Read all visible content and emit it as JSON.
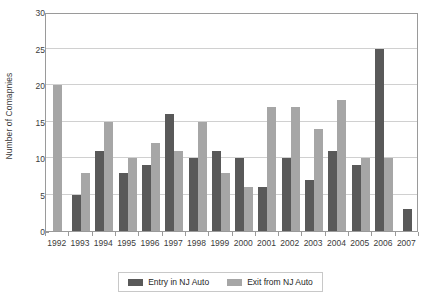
{
  "chart_data": {
    "type": "bar",
    "title": "",
    "xlabel": "",
    "ylabel": "Number of Comapnies",
    "ylim": [
      0,
      30
    ],
    "yticks": [
      0,
      5,
      10,
      15,
      20,
      25,
      30
    ],
    "grid": true,
    "legend_position": "bottom",
    "categories": [
      "1992",
      "1993",
      "1994",
      "1995",
      "1996",
      "1997",
      "1998",
      "1999",
      "2000",
      "2001",
      "2002",
      "2003",
      "2004",
      "2005",
      "2006",
      "2007"
    ],
    "series": [
      {
        "name": "Entry in NJ Auto",
        "color": "#595959",
        "values": [
          0,
          5,
          11,
          8,
          9,
          16,
          10,
          11,
          10,
          6,
          10,
          7,
          11,
          9,
          25,
          3
        ]
      },
      {
        "name": "Exit from NJ Auto",
        "color": "#a6a6a6",
        "values": [
          20,
          8,
          15,
          10,
          12,
          11,
          15,
          8,
          6,
          17,
          17,
          14,
          18,
          10,
          10,
          0
        ]
      }
    ]
  },
  "axis": {
    "y_title": "Number of Comapnies"
  },
  "legend": {
    "items": [
      {
        "label": "Entry in NJ Auto",
        "color": "#595959"
      },
      {
        "label": "Exit from NJ Auto",
        "color": "#a6a6a6"
      }
    ]
  },
  "colors": {
    "entry": "#595959",
    "exit": "#a6a6a6",
    "grid": "#d0d0d0",
    "frame": "#9a9a9a",
    "text": "#3b3b3b",
    "background": "#ffffff"
  }
}
